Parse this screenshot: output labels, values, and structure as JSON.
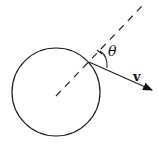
{
  "diagram": {
    "labels": {
      "angle": "θ",
      "vector": "v"
    },
    "colors": {
      "stroke": "#111111",
      "background": "#ffffff"
    }
  }
}
